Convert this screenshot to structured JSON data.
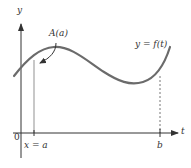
{
  "figure": {
    "type": "area-function-diagram",
    "axes": {
      "y_label": "y",
      "x_label": "t",
      "origin_label": "0"
    },
    "curve": {
      "label": "y = f(t)",
      "color": "#6b6b6b"
    },
    "markers": {
      "a": {
        "label": "x = a",
        "line_style": "solid",
        "line_color": "#c8c8c8"
      },
      "b": {
        "label": "b",
        "line_style": "dotted",
        "line_color": "#777777"
      }
    },
    "annotation": {
      "label": "A(a)",
      "arrow": true
    },
    "colors": {
      "axis": "#333333",
      "curve": "#6b6b6b",
      "text": "#333333"
    }
  }
}
